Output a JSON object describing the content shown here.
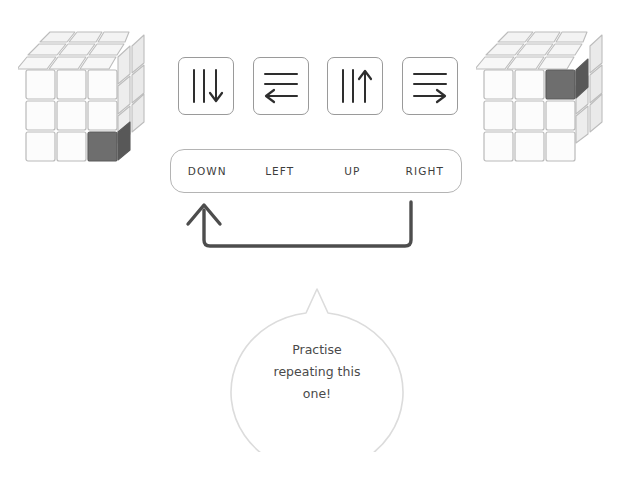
{
  "page": {
    "background": "#ffffff"
  },
  "colors": {
    "cubie_face": "#fcfcfc",
    "cubie_top": "#f2f2f2",
    "cubie_side": "#e4e4e4",
    "cubie_outline": "#b9b9b9",
    "highlight_front": "#6e6e6e",
    "highlight_top": "#8a8a8a",
    "highlight_side": "#585858",
    "ink": "#3a3a3a",
    "card_border": "#9a9a9a",
    "strip_border": "#b4b4b4",
    "bubble_border": "#d8d8d8",
    "arrow_stroke": "#4d4d4d"
  },
  "cubes": [
    {
      "name": "start-cube",
      "side": "left",
      "size": 3,
      "highlight": {
        "row": 3,
        "col": 3,
        "face": "front",
        "wraps_right_face": false
      },
      "caption": ""
    },
    {
      "name": "end-cube",
      "side": "right",
      "size": 3,
      "highlight": {
        "row": 1,
        "col": 3,
        "face": "front",
        "wraps_right_face": true
      },
      "caption": ""
    }
  ],
  "moves": {
    "cards": [
      {
        "icon": "arrow-down-icon",
        "direction": "down",
        "lines": "vertical",
        "label": "DOWN"
      },
      {
        "icon": "arrow-left-icon",
        "direction": "left",
        "lines": "horizontal",
        "label": "LEFT"
      },
      {
        "icon": "arrow-up-icon",
        "direction": "up",
        "lines": "vertical",
        "label": "UP"
      },
      {
        "icon": "arrow-right-icon",
        "direction": "right",
        "lines": "horizontal",
        "label": "RIGHT"
      }
    ]
  },
  "loop": {
    "icon": "repeat-loop-arrow-icon",
    "from": "RIGHT",
    "to": "DOWN",
    "description": "repeat sequence"
  },
  "bubble": {
    "icon": "speech-bubble-icon",
    "lines": [
      "Practise",
      "repeating this",
      "one!"
    ]
  }
}
